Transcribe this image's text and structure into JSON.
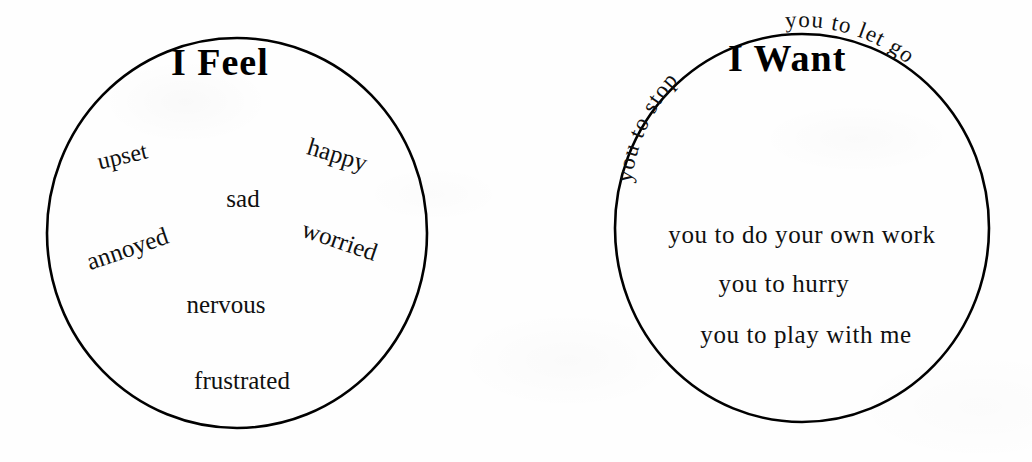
{
  "page": {
    "width": 1032,
    "height": 462,
    "background_color": "#fefefe",
    "ink_color": "#101010"
  },
  "circles": [
    {
      "id": "i-feel",
      "title": "I Feel",
      "center_x": 237,
      "center_y": 233,
      "radius_x": 190,
      "radius_y": 195,
      "stroke_color": "#000000",
      "words": [
        {
          "text": "upset",
          "x": 133,
          "y": 157,
          "rotate": -13,
          "size": 24
        },
        {
          "text": "happy",
          "x": 349,
          "y": 158,
          "rotate": 17,
          "size": 25
        },
        {
          "text": "sad",
          "x": 243,
          "y": 199,
          "rotate": 0,
          "size": 25
        },
        {
          "text": "annoyed",
          "x": 140,
          "y": 250,
          "rotate": -19,
          "size": 25
        },
        {
          "text": "worried",
          "x": 352,
          "y": 243,
          "rotate": 19,
          "size": 25
        },
        {
          "text": "nervous",
          "x": 226,
          "y": 305,
          "rotate": 0,
          "size": 25
        },
        {
          "text": "frustrated",
          "x": 242,
          "y": 381,
          "rotate": 0,
          "size": 25
        }
      ]
    },
    {
      "id": "i-want",
      "title": "I Want",
      "center_x": 802,
      "center_y": 228,
      "radius_x": 187,
      "radius_y": 194,
      "stroke_color": "#000000",
      "arc_phrases": [
        {
          "text": "you to stop",
          "size": 23,
          "start_offset": "4%",
          "letter_spacing": 1.2
        },
        {
          "text": "you to let go",
          "size": 23,
          "start_offset": "47%",
          "letter_spacing": 1.2
        }
      ],
      "words": [
        {
          "text": "you to do your own work",
          "x": 802,
          "y": 234,
          "rotate": 0,
          "size": 25
        },
        {
          "text": "you to hurry",
          "x": 784,
          "y": 283,
          "rotate": 0,
          "size": 25
        },
        {
          "text": "you to play with me",
          "x": 806,
          "y": 334,
          "rotate": 0,
          "size": 25
        }
      ]
    }
  ]
}
